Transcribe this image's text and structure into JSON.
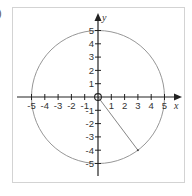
{
  "figure": {
    "partial_label": ")",
    "axes": {
      "x_label": "x",
      "y_label": "y",
      "x_ticks": [
        "-5",
        "-4",
        "-3",
        "-2",
        "-1",
        "1",
        "2",
        "3",
        "4",
        "5"
      ],
      "y_ticks": [
        "5",
        "4",
        "3",
        "2",
        "1",
        "-1",
        "-2",
        "-3",
        "-4",
        "-5"
      ]
    },
    "circle": {
      "center": [
        0,
        0
      ],
      "radius": 5
    },
    "radius_segment": {
      "from": [
        0,
        0
      ],
      "to": [
        3,
        -4
      ]
    },
    "colors": {
      "axes": "#222222",
      "circle": "#8a8a8a",
      "frame": "#d0d0d0",
      "text": "#333333"
    }
  }
}
